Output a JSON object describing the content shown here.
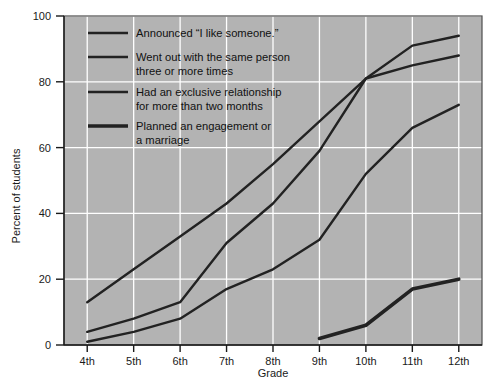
{
  "chart_data": {
    "type": "line",
    "title": "",
    "xlabel": "Grade",
    "ylabel": "Percent of students",
    "categories": [
      "4th",
      "5th",
      "6th",
      "7th",
      "8th",
      "9th",
      "10th",
      "11th",
      "12th"
    ],
    "ylim": [
      0,
      100
    ],
    "yticks": [
      0,
      20,
      40,
      60,
      80,
      100
    ],
    "ytick_labels": [
      "0",
      "20",
      "40",
      "60",
      "80",
      "100"
    ],
    "grid": true,
    "legend_position": "upper-left-inside",
    "plot_background": "#b3b3b3",
    "grid_color": "#ffffff",
    "line_color": "#222222",
    "series": [
      {
        "name": "Announced \"I like someone.\"",
        "values": [
          13,
          23,
          33,
          43,
          55,
          68,
          81,
          91,
          94
        ],
        "line_width": 2.4
      },
      {
        "name": "Went out with the same person three or more times",
        "values": [
          4,
          8,
          13,
          31,
          43,
          59,
          81,
          85,
          88
        ],
        "line_width": 2.4
      },
      {
        "name": "Had an exclusive relationship for more than two months",
        "values": [
          1,
          4,
          8,
          17,
          23,
          32,
          52,
          66,
          73
        ],
        "line_width": 2.4
      },
      {
        "name": "Planned an engagement or a marriage",
        "values": [
          null,
          null,
          null,
          null,
          null,
          2,
          6,
          17,
          20
        ],
        "line_width": 3.6
      }
    ]
  },
  "legend": {
    "entries": [
      {
        "line1": "Announced “I like someone.”",
        "line2": ""
      },
      {
        "line1": "Went out with the same person",
        "line2": "three or more times"
      },
      {
        "line1": "Had an exclusive relationship",
        "line2": "for more than two months"
      },
      {
        "line1": "Planned an engagement or",
        "line2": "a marriage"
      }
    ]
  },
  "axes": {
    "y_title": "Percent of students",
    "x_title": "Grade",
    "y_ticks": [
      "100",
      "80",
      "60",
      "40",
      "20",
      "0"
    ],
    "x_ticks": [
      "4th",
      "5th",
      "6th",
      "7th",
      "8th",
      "9th",
      "10th",
      "11th",
      "12th"
    ]
  }
}
